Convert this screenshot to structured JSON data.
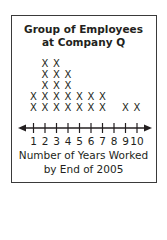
{
  "chart_data": {
    "type": "dot_plot",
    "title_lines": [
      "Group of Employees",
      "at Company Q"
    ],
    "xlabel": "Number of Years Worked by End of 2005",
    "xlabel_lines": [
      "Number of Years Worked",
      "by End of 2005"
    ],
    "ylabel": "",
    "marker": "X",
    "categories": [
      1,
      2,
      3,
      4,
      5,
      6,
      7,
      8,
      9,
      10
    ],
    "values": [
      2,
      5,
      5,
      4,
      2,
      2,
      2,
      0,
      1,
      1
    ],
    "tick_labels": [
      "1",
      "2",
      "3",
      "4",
      "5",
      "6",
      "7",
      "8",
      "9",
      "10"
    ],
    "xlim": [
      1,
      10
    ],
    "axis_arrows": true,
    "grid": false
  },
  "colors": {
    "ink": "#231f20",
    "frame": "#3a3a3a",
    "background": "#ffffff"
  }
}
